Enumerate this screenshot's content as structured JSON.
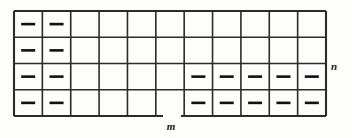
{
  "figure": {
    "kind": "grid-diagram",
    "background_color": "#fdfdfa",
    "line_color": "#2b2b2b",
    "mark_color": "#111111",
    "grid": {
      "columns": 11,
      "rows": 4,
      "x": 14,
      "y": 11,
      "width": 312,
      "height": 105,
      "cell_width": 28.364,
      "cell_height": 26.25,
      "outer_stroke_width": 2.1,
      "inner_stroke_width": 1.6
    },
    "marks": {
      "glyph": "dash",
      "description": "short thick horizontal dash centered in cell",
      "dash_width": 14,
      "dash_height": 2.6,
      "cells": [
        {
          "row": 1,
          "col": 1
        },
        {
          "row": 1,
          "col": 2
        },
        {
          "row": 2,
          "col": 1
        },
        {
          "row": 2,
          "col": 2
        },
        {
          "row": 3,
          "col": 1
        },
        {
          "row": 3,
          "col": 2
        },
        {
          "row": 4,
          "col": 1
        },
        {
          "row": 4,
          "col": 2
        },
        {
          "row": 3,
          "col": 7
        },
        {
          "row": 3,
          "col": 8
        },
        {
          "row": 3,
          "col": 9
        },
        {
          "row": 3,
          "col": 10
        },
        {
          "row": 3,
          "col": 11
        },
        {
          "row": 4,
          "col": 7
        },
        {
          "row": 4,
          "col": 8
        },
        {
          "row": 4,
          "col": 9
        },
        {
          "row": 4,
          "col": 10
        },
        {
          "row": 4,
          "col": 11
        }
      ]
    },
    "bottom_border_gap": {
      "present": true,
      "x_start": 163,
      "x_end": 181
    },
    "labels": {
      "width_label": "m",
      "width_label_x": 171,
      "width_label_y": 130,
      "height_label": "n",
      "height_label_x": 334,
      "height_label_y": 70
    }
  }
}
